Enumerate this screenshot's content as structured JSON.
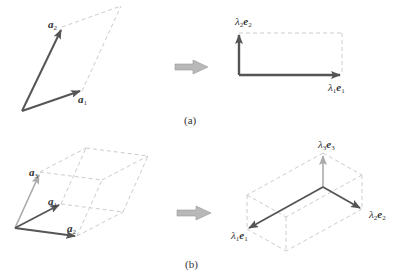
{
  "colors": {
    "vector": "#555555",
    "vector_light": "#aaaaaa",
    "dashed": "#cccccc",
    "transform_arrow": "#b0b0b0",
    "transform_arrow_stroke": "#999999"
  },
  "panel_a": {
    "caption": "(a)",
    "left": {
      "labels": {
        "a1": {
          "symbol": "a",
          "sub": "1"
        },
        "a2": {
          "symbol": "a",
          "sub": "2"
        }
      }
    },
    "right": {
      "labels": {
        "e1": {
          "lambda": "λ",
          "lsub": "1",
          "symbol": "e",
          "sub": "1"
        },
        "e2": {
          "lambda": "λ",
          "lsub": "2",
          "symbol": "e",
          "sub": "2"
        }
      }
    }
  },
  "panel_b": {
    "caption": "(b)",
    "left": {
      "labels": {
        "a1": {
          "symbol": "a",
          "sub": "1"
        },
        "a2": {
          "symbol": "a",
          "sub": "2"
        },
        "a3": {
          "symbol": "a",
          "sub": "3"
        }
      }
    },
    "right": {
      "labels": {
        "e1": {
          "lambda": "λ",
          "lsub": "1",
          "symbol": "e",
          "sub": "1"
        },
        "e2": {
          "lambda": "λ",
          "lsub": "2",
          "symbol": "e",
          "sub": "2"
        },
        "e3": {
          "lambda": "λ",
          "lsub": "3",
          "symbol": "e",
          "sub": "3"
        }
      }
    }
  }
}
